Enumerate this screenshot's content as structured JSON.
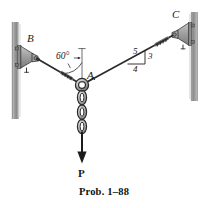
{
  "figure": {
    "caption": "Prob. 1–88",
    "points": {
      "a": "A",
      "b": "B",
      "c": "C"
    },
    "angle_label": "60°",
    "slope_triangle": {
      "hypotenuse": "5",
      "vertical": "3",
      "horizontal": "4"
    },
    "force_label": "P",
    "colors": {
      "line": "#2b2b2b",
      "wall_fill": "#9a9a9a",
      "wall_edge": "#5a5a5a",
      "bracket_fill": "#a8a8a8",
      "bracket_edge": "#3c3c3c",
      "chain_fill": "#bcbcbc",
      "chain_edge": "#2b2b2b",
      "text": "#1a1a1a"
    },
    "geometry": {
      "ring_center_x": 82,
      "ring_center_y": 85,
      "ring_radius": 6,
      "point_b_x": 27,
      "point_b_y": 52,
      "point_c_x": 172,
      "point_c_y": 33,
      "arrow_tip_y": 161,
      "angle_degrees": 60
    }
  }
}
